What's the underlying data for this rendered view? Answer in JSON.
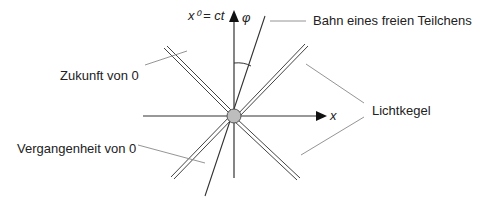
{
  "diagram": {
    "axes": {
      "vertical_label": "x⁰ = ct",
      "horizontal_label": "x",
      "angle_label": "φ"
    },
    "labels": {
      "trajectory": "Bahn eines freien Teilchens",
      "future": "Zukunft von 0",
      "past": "Vergangenheit von 0",
      "light_cone": "Lichtkegel"
    },
    "colors": {
      "line": "#444444",
      "origin_fill": "#bdbdbd",
      "leader": "#888888"
    }
  }
}
